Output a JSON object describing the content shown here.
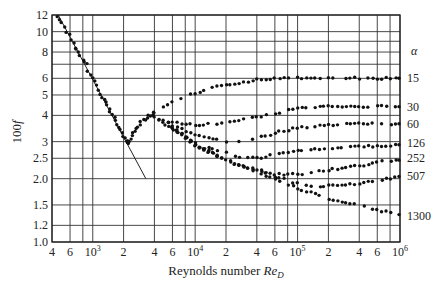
{
  "chart_data": {
    "type": "scatter",
    "title": "",
    "xlabel": "Reynolds number Re_D",
    "xlabel_parts": {
      "main": "Reynolds number ",
      "italic": "Re",
      "sub": "D"
    },
    "ylabel": "100 f",
    "ylabel_parts": {
      "main": "100",
      "italic": "f"
    },
    "xscale": "log",
    "yscale": "log",
    "xlim": [
      400,
      1000000
    ],
    "ylim": [
      1.0,
      12
    ],
    "grid": true,
    "x_ticks": [
      {
        "value": 400,
        "label": "4"
      },
      {
        "value": 600,
        "label": "6"
      },
      {
        "value": 1000,
        "label": "10",
        "sup": "3"
      },
      {
        "value": 2000,
        "label": "2"
      },
      {
        "value": 4000,
        "label": "4"
      },
      {
        "value": 6000,
        "label": "6"
      },
      {
        "value": 10000,
        "label": "10",
        "sup": "4"
      },
      {
        "value": 20000,
        "label": "2"
      },
      {
        "value": 40000,
        "label": "4"
      },
      {
        "value": 60000,
        "label": "6"
      },
      {
        "value": 100000,
        "label": "10",
        "sup": "5"
      },
      {
        "value": 200000,
        "label": "2"
      },
      {
        "value": 400000,
        "label": "4"
      },
      {
        "value": 600000,
        "label": "6"
      },
      {
        "value": 1000000,
        "label": "10",
        "sup": "6"
      }
    ],
    "x_gridlines": [
      400,
      600,
      800,
      1000,
      2000,
      4000,
      6000,
      8000,
      10000,
      20000,
      40000,
      60000,
      80000,
      100000,
      200000,
      400000,
      600000,
      800000,
      1000000
    ],
    "y_ticks": [
      {
        "value": 12,
        "label": "12"
      },
      {
        "value": 10,
        "label": "10"
      },
      {
        "value": 8,
        "label": "8"
      },
      {
        "value": 6,
        "label": "6"
      },
      {
        "value": 5,
        "label": "5"
      },
      {
        "value": 4,
        "label": "4"
      },
      {
        "value": 3,
        "label": "3"
      },
      {
        "value": 2.5,
        "label": "2.5"
      },
      {
        "value": 2.0,
        "label": "2.0"
      },
      {
        "value": 1.5,
        "label": "1.5"
      },
      {
        "value": 1.2,
        "label": "1.2"
      },
      {
        "value": 1.0,
        "label": "1.0"
      }
    ],
    "y_gridlines": [
      12,
      10,
      9,
      8,
      7,
      6,
      5,
      4,
      3,
      2.5,
      2.0,
      1.5,
      1.2,
      1.0
    ],
    "legend_title": "α",
    "legend_position": "right",
    "laminar_line": {
      "name": "laminar (64/Re)",
      "x": [
        460,
        3300
      ],
      "y": [
        12,
        2.0
      ]
    },
    "transition_points": {
      "x": [
        450,
        500,
        560,
        620,
        680,
        720,
        800,
        860,
        950,
        1050,
        1150,
        1250,
        1350,
        1450,
        1550,
        1650,
        1800,
        1950,
        2050,
        2150,
        2200,
        2250,
        2350,
        2500,
        2700,
        2900,
        3100,
        3400,
        3700,
        4000
      ],
      "y": [
        11.8,
        11.0,
        10.0,
        9.2,
        8.3,
        8.0,
        7.4,
        7.0,
        6.2,
        5.8,
        5.3,
        4.9,
        4.6,
        4.3,
        4.0,
        3.8,
        3.5,
        3.3,
        3.1,
        3.0,
        2.95,
        3.0,
        3.1,
        3.3,
        3.5,
        3.6,
        3.8,
        3.9,
        4.0,
        4.1
      ]
    },
    "series": [
      {
        "name": "15",
        "x": [
          4000,
          6000,
          10000,
          20000,
          40000,
          60000,
          100000,
          200000,
          400000,
          600000,
          1000000
        ],
        "y": [
          4.1,
          4.6,
          5.1,
          5.6,
          5.9,
          6.0,
          6.0,
          6.0,
          6.0,
          6.0,
          6.0
        ]
      },
      {
        "name": "30",
        "x": [
          4000,
          6000,
          10000,
          20000,
          40000,
          60000,
          100000,
          200000,
          400000,
          600000,
          1000000
        ],
        "y": [
          3.9,
          3.7,
          3.6,
          3.7,
          3.9,
          4.1,
          4.3,
          4.4,
          4.4,
          4.4,
          4.4
        ]
      },
      {
        "name": "60",
        "x": [
          4000,
          6000,
          10000,
          20000,
          40000,
          60000,
          100000,
          200000,
          400000,
          600000,
          1000000
        ],
        "y": [
          3.9,
          3.6,
          3.2,
          3.0,
          3.1,
          3.3,
          3.5,
          3.6,
          3.65,
          3.65,
          3.65
        ]
      },
      {
        "name": "126",
        "x": [
          5000,
          10000,
          20000,
          30000,
          40000,
          60000,
          100000,
          200000,
          400000,
          600000,
          1000000
        ],
        "y": [
          3.6,
          3.0,
          2.65,
          2.5,
          2.5,
          2.6,
          2.7,
          2.8,
          2.85,
          2.85,
          2.9
        ]
      },
      {
        "name": "252",
        "x": [
          6000,
          10000,
          20000,
          40000,
          60000,
          100000,
          200000,
          400000,
          600000,
          1000000
        ],
        "y": [
          3.5,
          2.9,
          2.45,
          2.2,
          2.1,
          2.1,
          2.2,
          2.3,
          2.4,
          2.45
        ]
      },
      {
        "name": "507",
        "x": [
          6000,
          10000,
          20000,
          40000,
          60000,
          100000,
          150000,
          200000,
          400000,
          600000,
          1000000
        ],
        "y": [
          3.5,
          2.9,
          2.45,
          2.2,
          2.05,
          1.9,
          1.85,
          1.85,
          1.9,
          1.95,
          2.05
        ]
      },
      {
        "name": "1300",
        "x": [
          6000,
          10000,
          20000,
          40000,
          60000,
          100000,
          200000,
          400000,
          600000,
          1000000
        ],
        "y": [
          3.5,
          2.9,
          2.45,
          2.15,
          2.0,
          1.8,
          1.6,
          1.5,
          1.42,
          1.35
        ]
      }
    ],
    "right_labels": [
      {
        "text": "15",
        "y": 6.0
      },
      {
        "text": "30",
        "y": 4.4
      },
      {
        "text": "60",
        "y": 3.65
      },
      {
        "text": "126",
        "y": 2.95
      },
      {
        "text": "252",
        "y": 2.5
      },
      {
        "text": "507",
        "y": 2.05
      },
      {
        "text": "1300",
        "y": 1.33
      }
    ]
  }
}
